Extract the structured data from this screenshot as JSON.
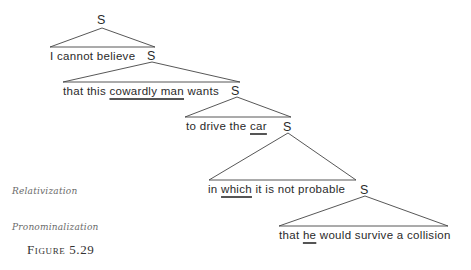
{
  "figure": {
    "caption": "Figure 5.29",
    "node_label": "S",
    "clauses": [
      {
        "parts": [
          {
            "text": "I cannot believe",
            "underline": false
          }
        ]
      },
      {
        "parts": [
          {
            "text": "that this ",
            "underline": false
          },
          {
            "text": "cowardly man",
            "underline": true
          },
          {
            "text": " wants",
            "underline": false
          }
        ]
      },
      {
        "parts": [
          {
            "text": "to drive the ",
            "underline": false
          },
          {
            "text": "car",
            "underline": true
          }
        ]
      },
      {
        "parts": [
          {
            "text": "in ",
            "underline": false
          },
          {
            "text": "which",
            "underline": true
          },
          {
            "text": " it is not probable",
            "underline": false
          }
        ]
      },
      {
        "parts": [
          {
            "text": "that ",
            "underline": false
          },
          {
            "text": "he",
            "underline": true
          },
          {
            "text": " would survive a collision",
            "underline": false
          }
        ]
      }
    ],
    "annotations": {
      "relativization": "Relativization",
      "pronominalization": "Pronominalization"
    }
  }
}
